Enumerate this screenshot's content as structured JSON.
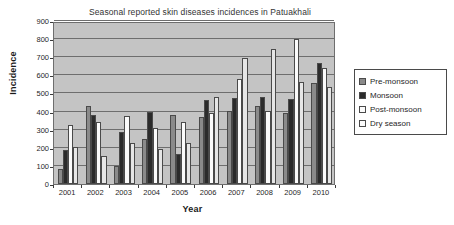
{
  "chart_data": {
    "type": "bar",
    "title": "Seasonal reported skin diseases incidences in Patuakhali",
    "xlabel": "Year",
    "ylabel": "Incidence",
    "categories": [
      "2001",
      "2002",
      "2003",
      "2004",
      "2005",
      "2006",
      "2007",
      "2008",
      "2009",
      "2010"
    ],
    "ylim": [
      0,
      900
    ],
    "ytick_step": 100,
    "yticks": [
      900,
      800,
      700,
      600,
      500,
      400,
      300,
      200,
      100,
      0
    ],
    "grid": true,
    "legend_position": "right",
    "series": [
      {
        "name": "Pre-monsoon",
        "color": "#8a8a8a",
        "values": [
          85,
          430,
          98,
          250,
          380,
          372,
          405,
          430,
          390,
          558
        ]
      },
      {
        "name": "Monsoon",
        "color": "#2b2b2b",
        "values": [
          190,
          383,
          285,
          397,
          168,
          465,
          477,
          480,
          472,
          668
        ]
      },
      {
        "name": "Post-monsoon",
        "color": "#fbfbfb",
        "values": [
          325,
          340,
          377,
          308,
          340,
          393,
          578,
          405,
          798,
          643
        ]
      },
      {
        "name": "Dry season",
        "color": "#e6e6e6",
        "values": [
          207,
          155,
          225,
          193,
          228,
          482,
          697,
          748,
          562,
          535
        ]
      }
    ],
    "plot_background": "#c4c4c4",
    "page_background": "#ffffff"
  }
}
